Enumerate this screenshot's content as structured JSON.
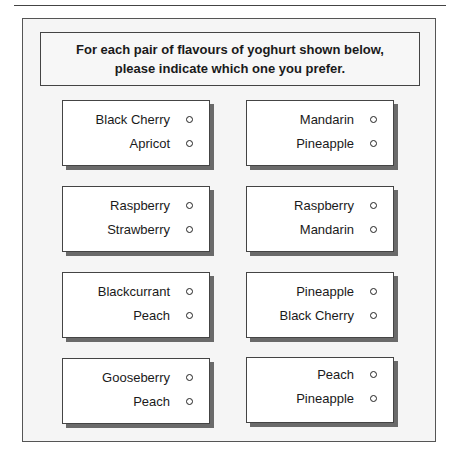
{
  "instructions": {
    "line1": "For each pair of flavours of yoghurt shown below,",
    "line2": "please indicate which one you prefer."
  },
  "pairs": [
    {
      "options": [
        "Black Cherry",
        "Apricot"
      ]
    },
    {
      "options": [
        "Mandarin",
        "Pineapple"
      ]
    },
    {
      "options": [
        "Raspberry",
        "Strawberry"
      ]
    },
    {
      "options": [
        "Raspberry",
        "Mandarin"
      ]
    },
    {
      "options": [
        "Blackcurrant",
        "Peach"
      ]
    },
    {
      "options": [
        "Pineapple",
        "Black Cherry"
      ]
    },
    {
      "options": [
        "Gooseberry",
        "Peach"
      ]
    },
    {
      "options": [
        "Peach",
        "Pineapple"
      ]
    }
  ]
}
